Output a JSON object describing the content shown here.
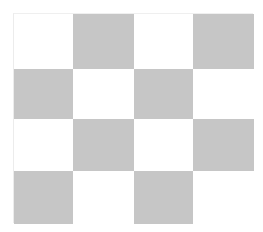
{
  "board": {
    "rows": 4,
    "cols": 4,
    "pattern": [
      [
        "light",
        "dark",
        "light",
        "dark"
      ],
      [
        "dark",
        "light",
        "dark",
        "light"
      ],
      [
        "light",
        "dark",
        "light",
        "dark"
      ],
      [
        "dark",
        "light",
        "dark",
        "light"
      ]
    ],
    "colors": {
      "light": "#ffffff",
      "dark": "#c6c6c6"
    }
  }
}
